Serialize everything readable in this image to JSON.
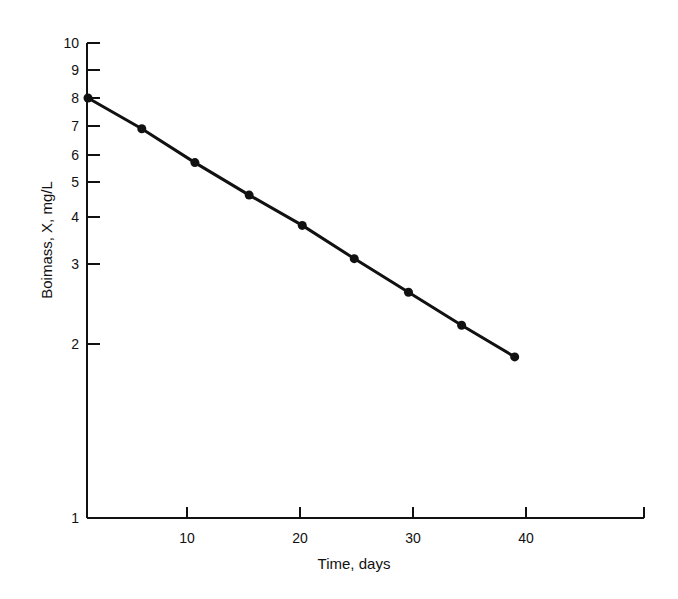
{
  "chart_data": {
    "type": "line",
    "title": "",
    "xlabel": "Time, days",
    "ylabel": "Boimass, X, mg/L",
    "yscale": "log",
    "xlim": [
      1.2,
      50
    ],
    "ylim": [
      1,
      10
    ],
    "grid": false,
    "legend": null,
    "x_ticks": [
      10,
      20,
      30,
      40
    ],
    "y_ticks": [
      1,
      2,
      3,
      4,
      5,
      6,
      7,
      8,
      9,
      10
    ],
    "y_tick_labels": [
      "1",
      "2",
      "3",
      "4",
      "5",
      "6",
      "7",
      "8",
      "9",
      "10"
    ],
    "series": [
      {
        "name": "Biomass",
        "marker": "circle",
        "x": [
          1.2,
          6,
          10.7,
          15.5,
          20.2,
          24.8,
          29.6,
          34.3,
          39
        ],
        "values": [
          8.0,
          6.9,
          5.7,
          4.6,
          3.8,
          3.1,
          2.6,
          2.2,
          1.9
        ]
      }
    ]
  },
  "axes": {
    "x_title": "Time, days",
    "y_title": "Boimass, X, mg/L",
    "x_tick_labels": [
      "10",
      "20",
      "30",
      "40"
    ],
    "y_tick_labels": [
      "1",
      "2",
      "3",
      "4",
      "5",
      "6",
      "7",
      "8",
      "9",
      "10"
    ]
  }
}
